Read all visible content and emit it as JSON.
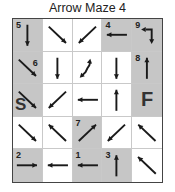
{
  "title": "Arrow Maze 4",
  "colors": {
    "shaded": "#c6c6c6",
    "arrow": "#1a1a1a",
    "border": "#444444"
  },
  "grid": {
    "rows": 5,
    "cols": 5,
    "cells": [
      {
        "row": 1,
        "col": 1,
        "shaded": true,
        "number": "5",
        "arrow": "down"
      },
      {
        "row": 1,
        "col": 2,
        "shaded": false,
        "arrow": "down-right"
      },
      {
        "row": 1,
        "col": 3,
        "shaded": false,
        "arrow": "down-left"
      },
      {
        "row": 1,
        "col": 4,
        "shaded": true,
        "number": "4",
        "arrow": "left"
      },
      {
        "row": 1,
        "col": 5,
        "shaded": true,
        "number": "9",
        "arrow": "bent-left-down"
      },
      {
        "row": 2,
        "col": 1,
        "shaded": true,
        "number": "6",
        "arrow": "down-right"
      },
      {
        "row": 2,
        "col": 2,
        "shaded": false,
        "arrow": "down"
      },
      {
        "row": 2,
        "col": 3,
        "shaded": false,
        "arrow": "curved-double"
      },
      {
        "row": 2,
        "col": 4,
        "shaded": false,
        "arrow": "down"
      },
      {
        "row": 2,
        "col": 5,
        "shaded": true,
        "number": "8",
        "arrow": "up"
      },
      {
        "row": 3,
        "col": 1,
        "shaded": true,
        "letter": "S",
        "arrow": "down-right"
      },
      {
        "row": 3,
        "col": 2,
        "shaded": false,
        "arrow": "down-left"
      },
      {
        "row": 3,
        "col": 3,
        "shaded": false,
        "arrow": "left"
      },
      {
        "row": 3,
        "col": 4,
        "shaded": false,
        "arrow": "up"
      },
      {
        "row": 3,
        "col": 5,
        "shaded": true,
        "letter": "F"
      },
      {
        "row": 4,
        "col": 1,
        "shaded": false,
        "arrow": "down-right"
      },
      {
        "row": 4,
        "col": 2,
        "shaded": false,
        "arrow": "up-left"
      },
      {
        "row": 4,
        "col": 3,
        "shaded": true,
        "number": "7",
        "arrow": "up-right"
      },
      {
        "row": 4,
        "col": 4,
        "shaded": false,
        "arrow": "down-left"
      },
      {
        "row": 4,
        "col": 5,
        "shaded": false,
        "arrow": "up-left"
      },
      {
        "row": 5,
        "col": 1,
        "shaded": true,
        "number": "2",
        "arrow": "right"
      },
      {
        "row": 5,
        "col": 2,
        "shaded": false,
        "arrow": "left"
      },
      {
        "row": 5,
        "col": 3,
        "shaded": true,
        "number": "1",
        "arrow": "left"
      },
      {
        "row": 5,
        "col": 4,
        "shaded": true,
        "number": "3",
        "arrow": "up"
      },
      {
        "row": 5,
        "col": 5,
        "shaded": false,
        "arrow": "up-left"
      }
    ]
  }
}
